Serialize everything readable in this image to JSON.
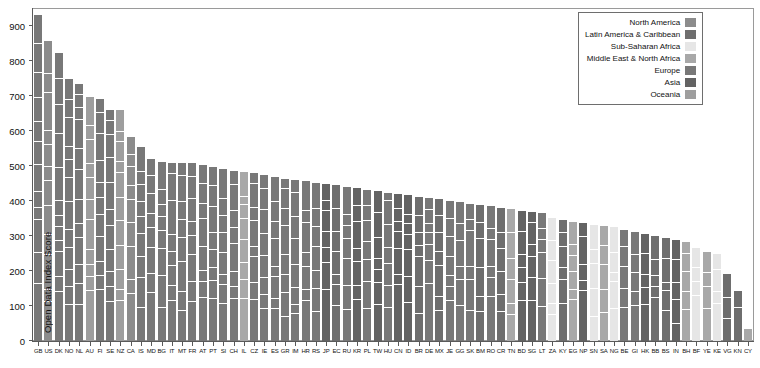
{
  "chart_data": {
    "type": "bar",
    "subtype": "stacked-bar",
    "title": "",
    "xlabel": "",
    "ylabel": "Open Data Index Score",
    "ylim": [
      0,
      950
    ],
    "yticks": [
      0,
      100,
      200,
      300,
      400,
      500,
      600,
      700,
      800,
      900
    ],
    "grid": false,
    "sorted": "descending-by-total",
    "legend_position": "top-right",
    "legend": [
      {
        "name": "North America",
        "color": "#8c8c8c"
      },
      {
        "name": "Latin America & Caribbean",
        "color": "#6e6e6e"
      },
      {
        "name": "Sub-Saharan Africa",
        "color": "#e6e6e6"
      },
      {
        "name": "Middle East & North Africa",
        "color": "#a8a8a8"
      },
      {
        "name": "Europe",
        "color": "#787878"
      },
      {
        "name": "Asia",
        "color": "#636363"
      },
      {
        "name": "Oceania",
        "color": "#9e9e9e"
      }
    ],
    "categories": [
      "GB",
      "US",
      "DK",
      "NO",
      "NL",
      "AU",
      "FI",
      "SE",
      "NZ",
      "CA",
      "IS",
      "MD",
      "BG",
      "IT",
      "MT",
      "FR",
      "AT",
      "PT",
      "SI",
      "CH",
      "IL",
      "CZ",
      "IE",
      "ES",
      "GR",
      "IM",
      "HR",
      "RS",
      "JP",
      "EC",
      "RU",
      "KR",
      "PL",
      "TW",
      "HU",
      "CN",
      "ID",
      "BR",
      "DE",
      "MX",
      "JE",
      "GG",
      "SK",
      "BM",
      "RO",
      "CR",
      "TN",
      "BD",
      "SG",
      "LT",
      "ZA",
      "KY",
      "EG",
      "NP",
      "SN",
      "SA",
      "NG",
      "BE",
      "GI",
      "HK",
      "BB",
      "BS",
      "IN",
      "BH",
      "BF",
      "YE",
      "KE",
      "VG",
      "KN",
      "CY"
    ],
    "values": [
      935,
      862,
      828,
      752,
      738,
      700,
      695,
      665,
      665,
      587,
      557,
      524,
      516,
      512,
      512,
      512,
      508,
      500,
      494,
      490,
      487,
      483,
      478,
      473,
      468,
      465,
      460,
      456,
      452,
      448,
      444,
      440,
      436,
      432,
      428,
      424,
      420,
      416,
      412,
      409,
      405,
      400,
      396,
      392,
      388,
      384,
      380,
      376,
      372,
      368,
      355,
      348,
      344,
      340,
      336,
      332,
      328,
      322,
      316,
      310,
      304,
      298,
      292,
      286,
      270,
      258,
      252,
      196,
      146,
      38
    ],
    "regions": [
      "Europe",
      "North America",
      "Europe",
      "Europe",
      "Europe",
      "Oceania",
      "Europe",
      "Europe",
      "Oceania",
      "North America",
      "Europe",
      "Europe",
      "Europe",
      "Europe",
      "Europe",
      "Europe",
      "Europe",
      "Europe",
      "Europe",
      "Europe",
      "Middle East & North Africa",
      "Europe",
      "Europe",
      "Europe",
      "Europe",
      "Europe",
      "Europe",
      "Europe",
      "Asia",
      "Latin America & Caribbean",
      "Europe",
      "Asia",
      "Europe",
      "Asia",
      "Europe",
      "Asia",
      "Asia",
      "Latin America & Caribbean",
      "Europe",
      "Latin America & Caribbean",
      "Europe",
      "Europe",
      "Europe",
      "Latin America & Caribbean",
      "Europe",
      "Latin America & Caribbean",
      "Middle East & North Africa",
      "Asia",
      "Asia",
      "Europe",
      "Sub-Saharan Africa",
      "Latin America & Caribbean",
      "Middle East & North Africa",
      "Asia",
      "Sub-Saharan Africa",
      "Middle East & North Africa",
      "Sub-Saharan Africa",
      "Europe",
      "Europe",
      "Asia",
      "Latin America & Caribbean",
      "Latin America & Caribbean",
      "Asia",
      "Middle East & North Africa",
      "Sub-Saharan Africa",
      "Middle East & North Africa",
      "Sub-Saharan Africa",
      "Latin America & Caribbean",
      "Latin America & Caribbean",
      "Middle East & North Africa"
    ],
    "segments_note": "Each bar is stacked from multiple dataset-category scores of equal region color, separated by white rules."
  }
}
